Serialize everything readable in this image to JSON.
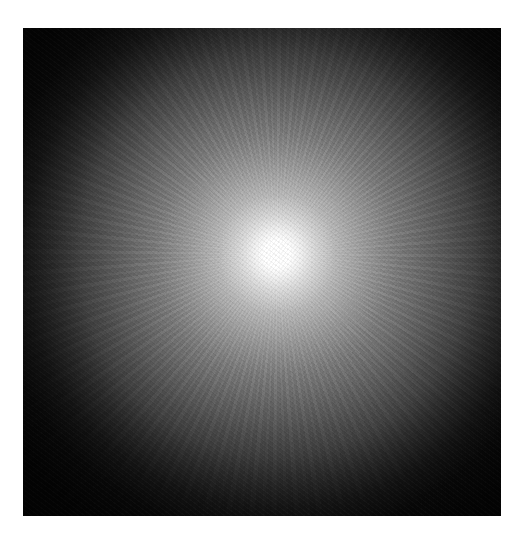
{
  "image": {
    "description": "Radial starburst glow: bright white core fading through grey to a near-black square background",
    "caption_fragment": "",
    "colors": {
      "core": "#ffffff",
      "mid": "#8a8a8a",
      "background": "#050505",
      "page": "#ffffff"
    }
  }
}
